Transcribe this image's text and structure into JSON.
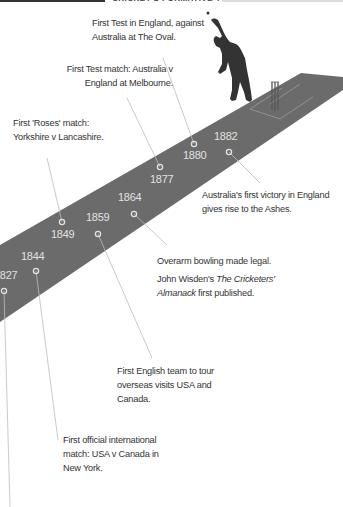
{
  "header": {
    "title": "CRICKET'S FORMATIVE YEARS"
  },
  "colors": {
    "pitch": "#6b6b6b",
    "crease": "#9a9a9a",
    "bowler": "#333333",
    "leader": "#bdbdbd",
    "year_text": "#e2e2e2",
    "annotation_text": "#333333"
  },
  "events": [
    {
      "year": "1827",
      "text": ""
    },
    {
      "year": "1844",
      "text": "First official international match: USA v Canada in New York."
    },
    {
      "year": "1849",
      "text": "First 'Roses' match: Yorkshire v Lancashire."
    },
    {
      "year": "1859",
      "text": "First English team to tour overseas visits USA and Canada."
    },
    {
      "year": "1864",
      "text": "Overarm bowling made legal.",
      "text2_prefix": "John Wisden's ",
      "text2_italic": "The Cricketers' Almanack",
      "text2_suffix": " first published."
    },
    {
      "year": "1877",
      "text": "First Test match: Australia v England at Melbourne."
    },
    {
      "year": "1880",
      "text": "First Test in England, against Australia at The Oval."
    },
    {
      "year": "1882",
      "text": "Australia's first victory in England gives rise to the Ashes."
    }
  ]
}
